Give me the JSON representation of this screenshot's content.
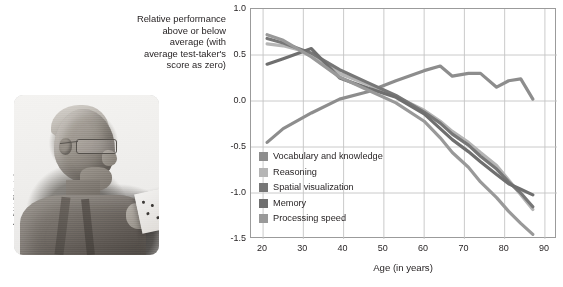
{
  "credit": "Ann Baldwin/Shutterstock",
  "photo": {
    "alt_name": "elderly-man-reading-card-photo"
  },
  "yaxis_description": [
    "Relative performance",
    "above or below",
    "average (with",
    "average test-taker's",
    "score as zero)"
  ],
  "chart_data": {
    "type": "line",
    "title": "",
    "xlabel": "Age (in years)",
    "ylabel": "Relative performance above or below average (with average test-taker's score as zero)",
    "xlim": [
      17,
      93
    ],
    "ylim": [
      -1.5,
      1.0
    ],
    "xticks": [
      20,
      30,
      40,
      50,
      60,
      70,
      80,
      90
    ],
    "yticks": [
      1.0,
      0.5,
      0.0,
      -0.5,
      -1.0,
      -1.5
    ],
    "ytick_labels": [
      "1.0",
      "0.5",
      "0.0",
      "-0.5",
      "-1.0",
      "-1.5"
    ],
    "xtick_labels": [
      "20",
      "30",
      "40",
      "50",
      "60",
      "70",
      "80",
      "90"
    ],
    "grid": true,
    "legend_position": "inside-lower-left",
    "series": [
      {
        "name": "Vocabulary and knowledge",
        "color": "#8d8d8d",
        "x": [
          21,
          25,
          32,
          39,
          46,
          53,
          60,
          64,
          67,
          71,
          74,
          78,
          81,
          84,
          87
        ],
        "y": [
          -0.45,
          -0.3,
          -0.13,
          0.02,
          0.1,
          0.22,
          0.33,
          0.38,
          0.27,
          0.3,
          0.3,
          0.15,
          0.22,
          0.24,
          0.02
        ]
      },
      {
        "name": "Reasoning",
        "color": "#b5b5b5",
        "x": [
          21,
          25,
          32,
          39,
          46,
          53,
          60,
          64,
          67,
          71,
          74,
          78,
          81,
          84,
          87
        ],
        "y": [
          0.62,
          0.6,
          0.52,
          0.3,
          0.18,
          0.05,
          -0.1,
          -0.22,
          -0.33,
          -0.45,
          -0.56,
          -0.7,
          -0.86,
          -1.02,
          -1.18
        ]
      },
      {
        "name": "Spatial visualization",
        "color": "#777777",
        "x": [
          21,
          25,
          32,
          39,
          46,
          53,
          60,
          64,
          67,
          71,
          74,
          78,
          81,
          84,
          87
        ],
        "y": [
          0.68,
          0.63,
          0.52,
          0.34,
          0.2,
          0.06,
          -0.12,
          -0.24,
          -0.36,
          -0.48,
          -0.6,
          -0.74,
          -0.88,
          -1.0,
          -1.15
        ]
      },
      {
        "name": "Memory",
        "color": "#6f6f6f",
        "x": [
          21,
          25,
          32,
          39,
          46,
          53,
          60,
          64,
          67,
          71,
          74,
          78,
          81,
          84,
          87
        ],
        "y": [
          0.4,
          0.46,
          0.57,
          0.25,
          0.14,
          0.04,
          -0.14,
          -0.3,
          -0.42,
          -0.55,
          -0.66,
          -0.8,
          -0.9,
          -0.96,
          -1.02
        ]
      },
      {
        "name": "Processing speed",
        "color": "#999999",
        "x": [
          21,
          25,
          32,
          39,
          46,
          53,
          60,
          64,
          67,
          71,
          74,
          78,
          81,
          84,
          87
        ],
        "y": [
          0.72,
          0.66,
          0.48,
          0.26,
          0.12,
          -0.02,
          -0.22,
          -0.4,
          -0.56,
          -0.72,
          -0.88,
          -1.05,
          -1.2,
          -1.33,
          -1.45
        ]
      }
    ]
  }
}
